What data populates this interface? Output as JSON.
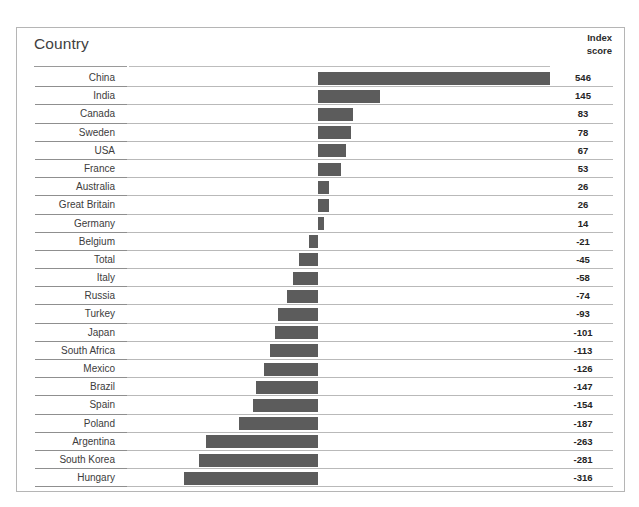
{
  "header": {
    "country_label": "Country",
    "index_label": "Index",
    "score_label": "score"
  },
  "colors": {
    "bar": "#5c5c5c",
    "frame": "#b5b5b5",
    "divider": "#b9b9b9",
    "background": "#ffffff"
  },
  "chart_data": {
    "type": "bar",
    "orientation": "horizontal",
    "title": "",
    "xlabel": "",
    "ylabel": "Country",
    "value_axis_label": "Index score",
    "zero_baseline": 0,
    "grid": false,
    "legend": "none",
    "xlim": [
      -316,
      546
    ],
    "categories": [
      "China",
      "India",
      "Canada",
      "Sweden",
      "USA",
      "France",
      "Australia",
      "Great Britain",
      "Germany",
      "Belgium",
      "Total",
      "Italy",
      "Russia",
      "Turkey",
      "Japan",
      "South Africa",
      "Mexico",
      "Brazil",
      "Spain",
      "Poland",
      "Argentina",
      "South Korea",
      "Hungary"
    ],
    "values": [
      546,
      145,
      83,
      78,
      67,
      53,
      26,
      26,
      14,
      -21,
      -45,
      -58,
      -74,
      -93,
      -101,
      -113,
      -126,
      -147,
      -154,
      -187,
      -263,
      -281,
      -316
    ],
    "value_labels": [
      "546",
      "145",
      "83",
      "78",
      "67",
      "53",
      "26",
      "26",
      "14",
      "-21",
      "-45",
      "-58",
      "-74",
      "-93",
      "-101",
      "-113",
      "-126",
      "-147",
      "-154",
      "-187",
      "-263",
      "-281",
      "-316"
    ]
  }
}
